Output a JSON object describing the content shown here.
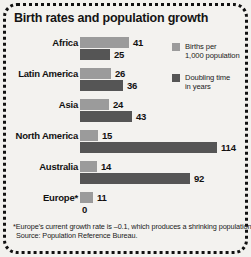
{
  "title": "Birth rates and population growth",
  "colors": {
    "births": "#9b9b9b",
    "doubling": "#555555",
    "background": "#f3f2ef",
    "text": "#111111",
    "border": "#111111"
  },
  "legend": {
    "items": [
      {
        "swatch": "births",
        "line1": "Births per",
        "line2": "1,000 population"
      },
      {
        "swatch": "doubling",
        "line1": "Doubling time",
        "line2": "in years"
      }
    ]
  },
  "footnote": {
    "line1": "*Europe's current growth rate is –0.1, which produces a shrinking population.",
    "line2": "Source: Population Reference Bureau."
  },
  "chart_data": {
    "type": "bar",
    "orientation": "horizontal",
    "title": "Birth rates and population growth",
    "xlabel": "",
    "ylabel": "",
    "grid": false,
    "legend_position": "right",
    "categories": [
      "Africa",
      "Latin America",
      "Asia",
      "North America",
      "Australia",
      "Europe*"
    ],
    "series": [
      {
        "name": "Births per 1,000 population",
        "color": "#9b9b9b",
        "values": [
          41,
          26,
          24,
          15,
          14,
          11
        ]
      },
      {
        "name": "Doubling time in years",
        "color": "#555555",
        "values": [
          25,
          36,
          43,
          114,
          92,
          0
        ]
      }
    ],
    "xlim": [
      0,
      114
    ],
    "px_per_unit": 1.2,
    "rows": [
      {
        "category": "Africa",
        "label_top": 37,
        "row_top": 37,
        "births": {
          "value": "41",
          "width": 49,
          "label_x": 133
        },
        "doubling": {
          "value": "25",
          "width": 30,
          "label_x": 114
        }
      },
      {
        "category": "Latin America",
        "label_top": 68,
        "row_top": 68,
        "births": {
          "value": "26",
          "width": 31,
          "label_x": 115
        },
        "doubling": {
          "value": "36",
          "width": 43,
          "label_x": 127
        }
      },
      {
        "category": "Asia",
        "label_top": 99,
        "row_top": 99,
        "births": {
          "value": "24",
          "width": 29,
          "label_x": 113
        },
        "doubling": {
          "value": "43",
          "width": 52,
          "label_x": 136
        }
      },
      {
        "category": "North America",
        "label_top": 130,
        "row_top": 130,
        "births": {
          "value": "15",
          "width": 18,
          "label_x": 102
        },
        "doubling": {
          "value": "114",
          "width": 137,
          "label_x": 221
        }
      },
      {
        "category": "Australia",
        "label_top": 161,
        "row_top": 161,
        "births": {
          "value": "14",
          "width": 17,
          "label_x": 101
        },
        "doubling": {
          "value": "92",
          "width": 110,
          "label_x": 194
        }
      },
      {
        "category": "Europe*",
        "label_top": 192,
        "row_top": 192,
        "births": {
          "value": "11",
          "width": 13,
          "label_x": 97
        },
        "doubling": {
          "value": "0",
          "width": 0,
          "label_x": 82
        }
      }
    ]
  }
}
